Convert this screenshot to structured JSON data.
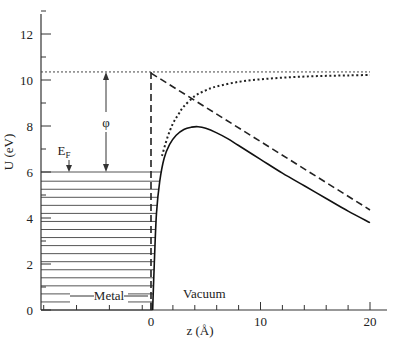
{
  "chart_data": {
    "type": "line",
    "title": "",
    "xlabel": "z (Å)",
    "ylabel": "U (eV)",
    "xlim": [
      -13.5,
      21.5
    ],
    "ylim": [
      0,
      13
    ],
    "grid": false,
    "x_ticks": [
      0,
      10,
      20
    ],
    "x_minor_ticks": [
      2,
      4,
      6,
      8,
      12,
      14,
      16,
      18
    ],
    "x_left_minor_ticks": [],
    "y_ticks": [
      0,
      2,
      4,
      6,
      8,
      10,
      12
    ],
    "y_minor_ticks": [
      1,
      3,
      5,
      7,
      9,
      11,
      13
    ],
    "annotations": {
      "fermi_label": "E",
      "fermi_sub": "F",
      "work_function": "φ",
      "metal": "Metal",
      "vacuum": "Vacuum"
    },
    "levels": {
      "vacuum_level": 10.35,
      "fermi_level": 6.0,
      "metal_band_lines": [
        0,
        0.35,
        0.7,
        1.05,
        1.4,
        1.75,
        2.1,
        2.45,
        2.8,
        3.15,
        3.5,
        3.85,
        4.2,
        4.55,
        4.9,
        5.25,
        5.6,
        6.0
      ]
    },
    "series": [
      {
        "name": "Total potential (solid)",
        "style": "solid",
        "x": [
          0.15,
          0.3,
          0.5,
          0.8,
          1.2,
          1.7,
          2.3,
          3.0,
          3.7,
          4.3,
          5.0,
          6.0,
          7.0,
          8.0,
          10.0,
          12.0,
          14.0,
          16.0,
          18.0,
          20.0
        ],
        "y": [
          0.0,
          2.0,
          4.2,
          5.6,
          6.6,
          7.2,
          7.6,
          7.85,
          7.95,
          7.97,
          7.9,
          7.7,
          7.45,
          7.15,
          6.55,
          5.95,
          5.4,
          4.85,
          4.3,
          3.8
        ]
      },
      {
        "name": "Image potential (dotted)",
        "style": "dotted",
        "x": [
          1.0,
          1.5,
          2.0,
          2.5,
          3.0,
          4.0,
          5.0,
          6.0,
          8.0,
          10.0,
          12.0,
          14.0,
          16.0,
          18.0,
          20.0
        ],
        "y": [
          6.7,
          7.5,
          8.1,
          8.5,
          8.85,
          9.3,
          9.55,
          9.72,
          9.92,
          10.03,
          10.1,
          10.15,
          10.18,
          10.2,
          10.22
        ]
      },
      {
        "name": "Applied field (dashed)",
        "style": "dashed",
        "x": [
          0,
          20
        ],
        "y": [
          10.3,
          4.35
        ]
      },
      {
        "name": "Surface (dashed vertical)",
        "style": "dashed",
        "x": [
          0,
          0
        ],
        "y": [
          0,
          10.35
        ]
      }
    ]
  }
}
